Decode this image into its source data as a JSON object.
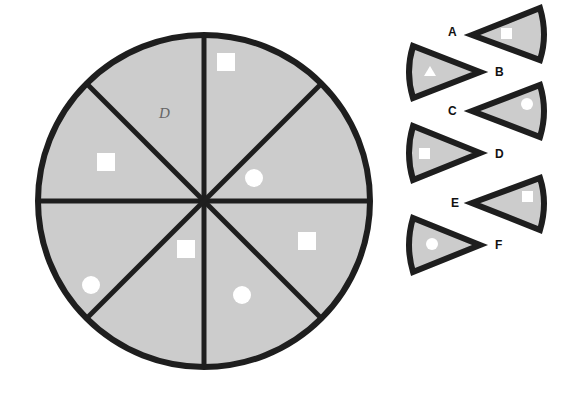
{
  "colors": {
    "fill": "#cccccc",
    "stroke": "#1e1e1e",
    "symbol": "#ffffff",
    "pencil": "#555555"
  },
  "wheel": {
    "center": [
      204,
      201
    ],
    "radius": 166,
    "segments": [
      {
        "index": 0,
        "position": "top-right-upper",
        "symbol": "square"
      },
      {
        "index": 1,
        "position": "top-right-lower",
        "symbol": "circle"
      },
      {
        "index": 2,
        "position": "bottom-right-upper",
        "symbol": "square"
      },
      {
        "index": 3,
        "position": "bottom-right-lower",
        "symbol": "circle"
      },
      {
        "index": 4,
        "position": "bottom-left-lower",
        "symbol": "square"
      },
      {
        "index": 5,
        "position": "bottom-left-upper",
        "symbol": "circle"
      },
      {
        "index": 6,
        "position": "top-left-lower",
        "symbol": "square"
      },
      {
        "index": 7,
        "position": "top-left-upper",
        "symbol": "missing",
        "pencil_mark": "D"
      }
    ]
  },
  "options": [
    {
      "label": "A",
      "symbol": "square",
      "orientation": "point-left"
    },
    {
      "label": "B",
      "symbol": "triangle",
      "orientation": "point-right"
    },
    {
      "label": "C",
      "symbol": "circle",
      "orientation": "point-left"
    },
    {
      "label": "D",
      "symbol": "square",
      "orientation": "point-right"
    },
    {
      "label": "E",
      "symbol": "square",
      "orientation": "point-left"
    },
    {
      "label": "F",
      "symbol": "circle",
      "orientation": "point-right"
    }
  ]
}
